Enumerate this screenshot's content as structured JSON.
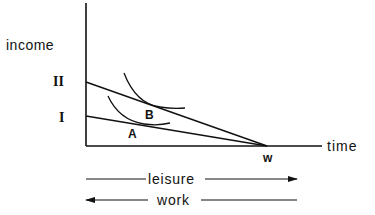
{
  "diagram": {
    "axes": {
      "y_label": "income",
      "x_label": "time"
    },
    "income_levels": [
      {
        "id": "I",
        "label": "I"
      },
      {
        "id": "II",
        "label": "II"
      }
    ],
    "points": [
      {
        "id": "A",
        "label": "A"
      },
      {
        "id": "B",
        "label": "B"
      },
      {
        "id": "w",
        "label": "w"
      }
    ],
    "budget_lines": [
      {
        "name": "budget-line-II",
        "from": "II",
        "to": "w"
      },
      {
        "name": "budget-line-I",
        "from": "I",
        "to": "w"
      }
    ],
    "indifference_curves": [
      {
        "name": "indifference-curve-B",
        "tangent_point": "B"
      },
      {
        "name": "indifference-curve-A",
        "tangent_point": "A"
      }
    ],
    "arrows": {
      "leisure": {
        "label": "leisure",
        "direction": "right"
      },
      "work": {
        "label": "work",
        "direction": "left"
      }
    },
    "colors": {
      "ink": "#111111",
      "background": "#ffffff"
    }
  }
}
